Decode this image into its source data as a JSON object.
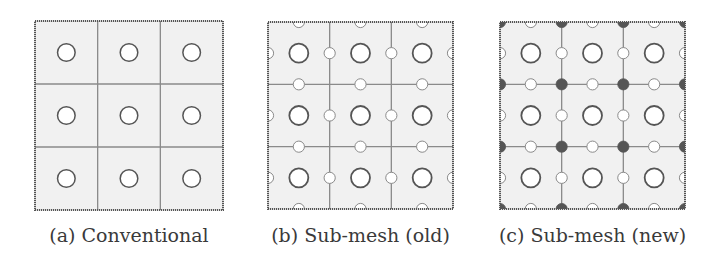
{
  "figure": {
    "panels": [
      {
        "id": "a",
        "caption": "(a) Conventional",
        "box": {
          "x": 35,
          "y": 21,
          "w": 188,
          "h": 189
        },
        "grid": 3,
        "cell_nodes": true,
        "edge_nodes": false,
        "vertex_nodes": false
      },
      {
        "id": "b",
        "caption": "(b) Sub-mesh (old)",
        "box": {
          "x": 268,
          "y": 22,
          "w": 185,
          "h": 187
        },
        "grid": 3,
        "cell_nodes": true,
        "edge_nodes": true,
        "vertex_nodes": false
      },
      {
        "id": "c",
        "caption": "(c) Sub-mesh (new)",
        "box": {
          "x": 500,
          "y": 22,
          "w": 185,
          "h": 187
        },
        "grid": 3,
        "cell_nodes": true,
        "edge_nodes": true,
        "vertex_nodes": true
      }
    ],
    "legend_semantics": {
      "large-open-circle": "cell-centered node",
      "small-open-circle": "edge/face node",
      "filled-dark-circle": "vertex node"
    },
    "colors": {
      "cell_fill": "#f1f1f1",
      "grid_line": "#8a8a8a",
      "border": "#555555",
      "circle_stroke": "#555555",
      "circle_fill": "#ffffff",
      "vertex_fill": "#555555",
      "caption": "#3a3a3a"
    }
  }
}
